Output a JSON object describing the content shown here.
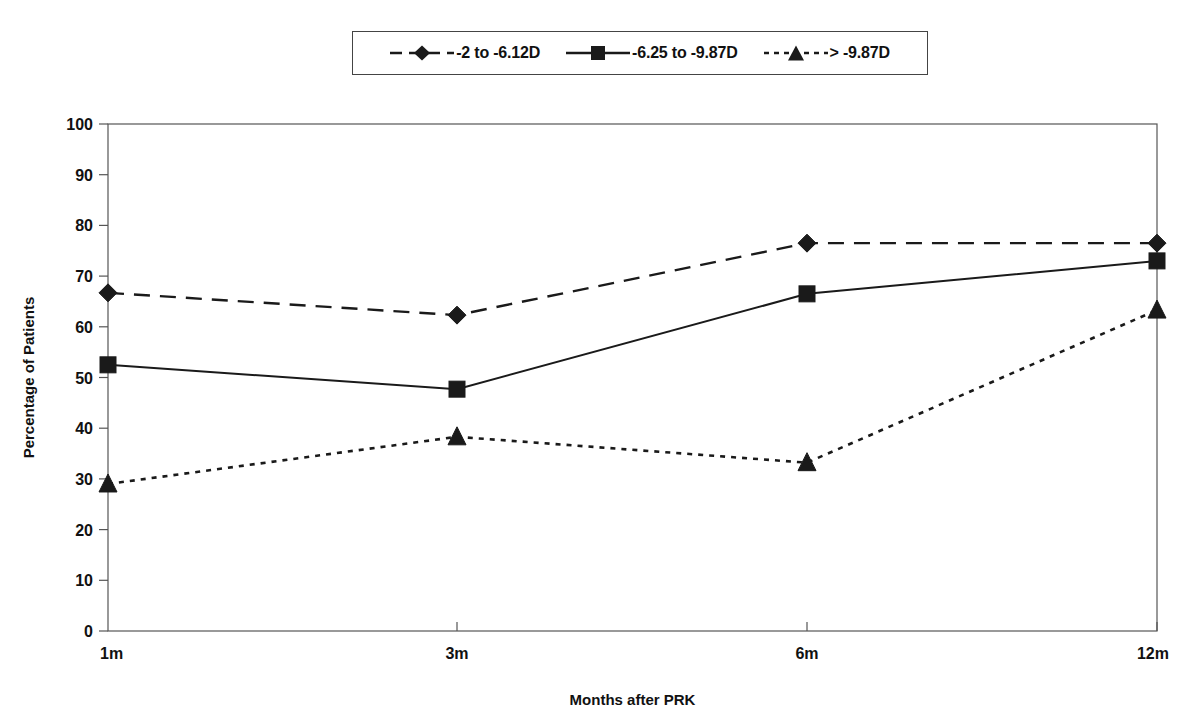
{
  "chart_data": {
    "type": "line",
    "title": "",
    "xlabel": "Months after PRK",
    "ylabel": "Percentage of Patients",
    "categories": [
      "1m",
      "3m",
      "6m",
      "12m"
    ],
    "x_tick_labels": [
      "1m",
      "3m",
      "6m",
      "12m"
    ],
    "y_tick_labels": [
      "0",
      "10",
      "20",
      "30",
      "40",
      "50",
      "60",
      "70",
      "80",
      "90",
      "100"
    ],
    "y_ticks": [
      0,
      10,
      20,
      30,
      40,
      50,
      60,
      70,
      80,
      90,
      100
    ],
    "ylim": [
      0,
      100
    ],
    "grid": false,
    "legend_position": "top-center",
    "series": [
      {
        "name": "-2 to -6.12D",
        "marker": "diamond",
        "line_style": "dashed",
        "color": "#1a1a1a",
        "values": [
          66.7,
          62.3,
          76.5,
          76.5
        ]
      },
      {
        "name": "-6.25 to -9.87D",
        "marker": "square",
        "line_style": "solid",
        "color": "#1a1a1a",
        "values": [
          52.5,
          47.7,
          66.5,
          73.0
        ]
      },
      {
        "name": "> -9.87D",
        "marker": "triangle",
        "line_style": "dotted",
        "color": "#1a1a1a",
        "values": [
          29.0,
          38.3,
          33.2,
          63.3
        ]
      }
    ]
  },
  "legend": {
    "entries": [
      {
        "label": "-2 to -6.12D",
        "marker": "diamond-icon",
        "line_style": "dashed"
      },
      {
        "label": "-6.25 to -9.87D",
        "marker": "square-icon",
        "line_style": "solid"
      },
      {
        "label": "> -9.87D",
        "marker": "triangle-icon",
        "line_style": "dotted"
      }
    ]
  },
  "axes": {
    "x_title": "Months after PRK",
    "y_title": "Percentage of Patients"
  }
}
